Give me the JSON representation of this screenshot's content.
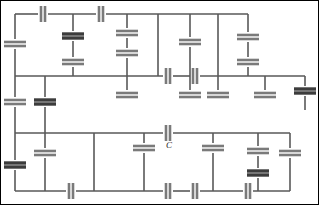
{
  "figure": {
    "width": 319,
    "height": 205,
    "background_color": "#ffffff",
    "border_color": "#000000",
    "wire_color": "#595959",
    "plate_color": "#7a7a7a",
    "plate_color_dark": "#3c3c3c"
  },
  "labels": [
    {
      "name": "capacitor-label-c",
      "text": "C",
      "x": 166,
      "y": 148
    }
  ],
  "wires": [
    {
      "name": "wire-top-bus-left",
      "x1": 15,
      "y1": 14,
      "x2": 38,
      "y2": 14
    },
    {
      "name": "wire-top-bus-mid",
      "x1": 48,
      "y1": 14,
      "x2": 96,
      "y2": 14
    },
    {
      "name": "wire-top-bus-right",
      "x1": 106,
      "y1": 14,
      "x2": 248,
      "y2": 14
    },
    {
      "name": "wire-bus2",
      "x1": 15,
      "y1": 76,
      "x2": 163,
      "y2": 76
    },
    {
      "name": "wire-bus2-seg2",
      "x1": 173,
      "y1": 76,
      "x2": 190,
      "y2": 76
    },
    {
      "name": "wire-bus2-seg3",
      "x1": 200,
      "y1": 76,
      "x2": 305,
      "y2": 76
    },
    {
      "name": "wire-bus3-left",
      "x1": 15,
      "y1": 133,
      "x2": 163,
      "y2": 133
    },
    {
      "name": "wire-bus3-right",
      "x1": 173,
      "y1": 133,
      "x2": 290,
      "y2": 133
    },
    {
      "name": "wire-bottom-bus-a",
      "x1": 15,
      "y1": 191,
      "x2": 66,
      "y2": 191
    },
    {
      "name": "wire-bottom-bus-b",
      "x1": 76,
      "y1": 191,
      "x2": 163,
      "y2": 191
    },
    {
      "name": "wire-bottom-bus-c",
      "x1": 173,
      "y1": 191,
      "x2": 190,
      "y2": 191
    },
    {
      "name": "wire-bottom-bus-d",
      "x1": 200,
      "y1": 191,
      "x2": 243,
      "y2": 191
    },
    {
      "name": "wire-bottom-bus-e",
      "x1": 253,
      "y1": 191,
      "x2": 290,
      "y2": 191
    },
    {
      "name": "wire-left-rail-upper",
      "x1": 15,
      "y1": 14,
      "x2": 15,
      "y2": 39
    },
    {
      "name": "wire-left-rail-mid",
      "x1": 15,
      "y1": 49,
      "x2": 15,
      "y2": 97
    },
    {
      "name": "wire-left-rail-lower",
      "x1": 15,
      "y1": 107,
      "x2": 15,
      "y2": 133
    },
    {
      "name": "wire-left-rail-bottom",
      "x1": 15,
      "y1": 133,
      "x2": 15,
      "y2": 160
    },
    {
      "name": "wire-left-rail-foot",
      "x1": 15,
      "y1": 170,
      "x2": 15,
      "y2": 191
    },
    {
      "name": "wire-branch-x45-upper",
      "x1": 45,
      "y1": 76,
      "x2": 45,
      "y2": 97
    },
    {
      "name": "wire-branch-x45-lower",
      "x1": 45,
      "y1": 107,
      "x2": 45,
      "y2": 133
    },
    {
      "name": "wire-branch-x45-foot",
      "x1": 45,
      "y1": 133,
      "x2": 45,
      "y2": 148
    },
    {
      "name": "wire-branch-x45-foot2",
      "x1": 45,
      "y1": 158,
      "x2": 45,
      "y2": 191
    },
    {
      "name": "wire-branch-x73-top",
      "x1": 73,
      "y1": 14,
      "x2": 73,
      "y2": 31
    },
    {
      "name": "wire-branch-x73-mid",
      "x1": 73,
      "y1": 41,
      "x2": 73,
      "y2": 57
    },
    {
      "name": "wire-branch-x73-low",
      "x1": 73,
      "y1": 67,
      "x2": 73,
      "y2": 76
    },
    {
      "name": "wire-branch-x94-down",
      "x1": 94,
      "y1": 133,
      "x2": 94,
      "y2": 191
    },
    {
      "name": "wire-branch-x127-a",
      "x1": 127,
      "y1": 14,
      "x2": 127,
      "y2": 28
    },
    {
      "name": "wire-branch-x127-b",
      "x1": 127,
      "y1": 38,
      "x2": 127,
      "y2": 48
    },
    {
      "name": "wire-branch-x127-c",
      "x1": 127,
      "y1": 58,
      "x2": 127,
      "y2": 76
    },
    {
      "name": "wire-branch-x127-d",
      "x1": 127,
      "y1": 76,
      "x2": 127,
      "y2": 90
    },
    {
      "name": "wire-branch-x158-top",
      "x1": 158,
      "y1": 14,
      "x2": 158,
      "y2": 76
    },
    {
      "name": "wire-branch-x190-a",
      "x1": 190,
      "y1": 14,
      "x2": 190,
      "y2": 37
    },
    {
      "name": "wire-branch-x190-b",
      "x1": 190,
      "y1": 47,
      "x2": 190,
      "y2": 76
    },
    {
      "name": "wire-branch-x190-c",
      "x1": 190,
      "y1": 76,
      "x2": 190,
      "y2": 90
    },
    {
      "name": "wire-branch-x218-top",
      "x1": 218,
      "y1": 14,
      "x2": 218,
      "y2": 76
    },
    {
      "name": "wire-branch-x218-down",
      "x1": 218,
      "y1": 76,
      "x2": 218,
      "y2": 90
    },
    {
      "name": "wire-branch-x248-a",
      "x1": 248,
      "y1": 14,
      "x2": 248,
      "y2": 32
    },
    {
      "name": "wire-branch-x248-b",
      "x1": 248,
      "y1": 42,
      "x2": 248,
      "y2": 57
    },
    {
      "name": "wire-branch-x248-c",
      "x1": 248,
      "y1": 67,
      "x2": 248,
      "y2": 76
    },
    {
      "name": "wire-right-rail",
      "x1": 305,
      "y1": 76,
      "x2": 305,
      "y2": 86
    },
    {
      "name": "wire-right-rail-b",
      "x1": 305,
      "y1": 96,
      "x2": 305,
      "y2": 110
    },
    {
      "name": "wire-branch-x265-down",
      "x1": 265,
      "y1": 76,
      "x2": 265,
      "y2": 90
    },
    {
      "name": "wire-branch-x144-down",
      "x1": 144,
      "y1": 133,
      "x2": 144,
      "y2": 143
    },
    {
      "name": "wire-branch-x144-down2",
      "x1": 144,
      "y1": 153,
      "x2": 144,
      "y2": 191
    },
    {
      "name": "wire-branch-x213-down",
      "x1": 213,
      "y1": 133,
      "x2": 213,
      "y2": 143
    },
    {
      "name": "wire-branch-x213-down2",
      "x1": 213,
      "y1": 153,
      "x2": 213,
      "y2": 191
    },
    {
      "name": "wire-branch-x258-down",
      "x1": 258,
      "y1": 133,
      "x2": 258,
      "y2": 146
    },
    {
      "name": "wire-branch-x258-down2",
      "x1": 258,
      "y1": 156,
      "x2": 258,
      "y2": 168
    },
    {
      "name": "wire-branch-x258-down3",
      "x1": 258,
      "y1": 178,
      "x2": 258,
      "y2": 191
    },
    {
      "name": "wire-branch-x290-top",
      "x1": 290,
      "y1": 133,
      "x2": 290,
      "y2": 148
    },
    {
      "name": "wire-branch-x290-bot",
      "x1": 290,
      "y1": 158,
      "x2": 290,
      "y2": 191
    },
    {
      "name": "wire-stub-x15-bus2",
      "x1": 15,
      "y1": 76,
      "x2": 15,
      "y2": 76
    }
  ],
  "capacitors": [
    {
      "name": "cap-top-1",
      "orientation": "horizontal",
      "cx": 43,
      "cy": 14,
      "plate_len": 16,
      "thick": false
    },
    {
      "name": "cap-top-2",
      "orientation": "horizontal",
      "cx": 101,
      "cy": 14,
      "plate_len": 16,
      "thick": false
    },
    {
      "name": "cap-left-rail-1",
      "orientation": "vertical",
      "cx": 15,
      "cy": 44,
      "plate_len": 22,
      "thick": false
    },
    {
      "name": "cap-left-rail-2",
      "orientation": "vertical",
      "cx": 15,
      "cy": 102,
      "plate_len": 22,
      "thick": false
    },
    {
      "name": "cap-left-rail-3",
      "orientation": "vertical",
      "cx": 15,
      "cy": 165,
      "plate_len": 22,
      "thick": true
    },
    {
      "name": "cap-x45-1",
      "orientation": "vertical",
      "cx": 45,
      "cy": 102,
      "plate_len": 22,
      "thick": true
    },
    {
      "name": "cap-x45-2",
      "orientation": "vertical",
      "cx": 45,
      "cy": 153,
      "plate_len": 22,
      "thick": false
    },
    {
      "name": "cap-x73-1",
      "orientation": "vertical",
      "cx": 73,
      "cy": 36,
      "plate_len": 22,
      "thick": true
    },
    {
      "name": "cap-x73-2",
      "orientation": "vertical",
      "cx": 73,
      "cy": 62,
      "plate_len": 22,
      "thick": false
    },
    {
      "name": "cap-x127-1",
      "orientation": "vertical",
      "cx": 127,
      "cy": 33,
      "plate_len": 22,
      "thick": false
    },
    {
      "name": "cap-x127-2",
      "orientation": "vertical",
      "cx": 127,
      "cy": 53,
      "plate_len": 22,
      "thick": false
    },
    {
      "name": "cap-bus2-1",
      "orientation": "horizontal",
      "cx": 168,
      "cy": 76,
      "plate_len": 16,
      "thick": false
    },
    {
      "name": "cap-bus2-2",
      "orientation": "horizontal",
      "cx": 195,
      "cy": 76,
      "plate_len": 16,
      "thick": false
    },
    {
      "name": "cap-x190-1",
      "orientation": "vertical",
      "cx": 190,
      "cy": 42,
      "plate_len": 22,
      "thick": false
    },
    {
      "name": "cap-x248-1",
      "orientation": "vertical",
      "cx": 248,
      "cy": 37,
      "plate_len": 22,
      "thick": false
    },
    {
      "name": "cap-x248-2",
      "orientation": "vertical",
      "cx": 248,
      "cy": 62,
      "plate_len": 22,
      "thick": false
    },
    {
      "name": "cap-right-rail-1",
      "orientation": "vertical",
      "cx": 305,
      "cy": 91,
      "plate_len": 22,
      "thick": true
    },
    {
      "name": "cap-stub-x127",
      "orientation": "vertical",
      "cx": 127,
      "cy": 95,
      "plate_len": 22,
      "thick": false
    },
    {
      "name": "cap-stub-x190",
      "orientation": "vertical",
      "cx": 190,
      "cy": 95,
      "plate_len": 22,
      "thick": false
    },
    {
      "name": "cap-stub-x218",
      "orientation": "vertical",
      "cx": 218,
      "cy": 95,
      "plate_len": 22,
      "thick": false
    },
    {
      "name": "cap-stub-x265",
      "orientation": "vertical",
      "cx": 265,
      "cy": 95,
      "plate_len": 22,
      "thick": false
    },
    {
      "name": "cap-bus3-c",
      "orientation": "horizontal",
      "cx": 168,
      "cy": 133,
      "plate_len": 16,
      "thick": false
    },
    {
      "name": "cap-x144-1",
      "orientation": "vertical",
      "cx": 144,
      "cy": 148,
      "plate_len": 22,
      "thick": false
    },
    {
      "name": "cap-x213-1",
      "orientation": "vertical",
      "cx": 213,
      "cy": 148,
      "plate_len": 22,
      "thick": false
    },
    {
      "name": "cap-x258-1",
      "orientation": "vertical",
      "cx": 258,
      "cy": 151,
      "plate_len": 22,
      "thick": false
    },
    {
      "name": "cap-x258-2",
      "orientation": "vertical",
      "cx": 258,
      "cy": 173,
      "plate_len": 22,
      "thick": true
    },
    {
      "name": "cap-x290-1",
      "orientation": "vertical",
      "cx": 290,
      "cy": 153,
      "plate_len": 22,
      "thick": false
    },
    {
      "name": "cap-bottom-1",
      "orientation": "horizontal",
      "cx": 71,
      "cy": 191,
      "plate_len": 16,
      "thick": false
    },
    {
      "name": "cap-bottom-2",
      "orientation": "horizontal",
      "cx": 168,
      "cy": 191,
      "plate_len": 16,
      "thick": false
    },
    {
      "name": "cap-bottom-3",
      "orientation": "horizontal",
      "cx": 195,
      "cy": 191,
      "plate_len": 16,
      "thick": false
    },
    {
      "name": "cap-bottom-4",
      "orientation": "horizontal",
      "cx": 248,
      "cy": 191,
      "plate_len": 16,
      "thick": false
    }
  ],
  "frame": {
    "name": "figure-border",
    "x": 0.5,
    "y": 0.5,
    "width": 318,
    "height": 204
  }
}
